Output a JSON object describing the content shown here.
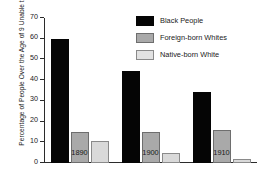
{
  "chart_data": {
    "type": "bar",
    "title": "",
    "xlabel": "",
    "ylabel": "Percentage of People Over the Age of 9 Unable to Read",
    "categories": [
      "1890",
      "1900",
      "1910"
    ],
    "ylim": [
      0,
      70
    ],
    "yticks": [
      0,
      10,
      20,
      30,
      40,
      50,
      60,
      70
    ],
    "ytick_labels": [
      "0",
      "10",
      "20",
      "30",
      "40",
      "50",
      "60",
      "70"
    ],
    "grid": false,
    "legend_position": "top-right",
    "series": [
      {
        "name": "Black People",
        "color": "#050505",
        "values": [
          60.0,
          44.5,
          34.3
        ]
      },
      {
        "name": "Foreign-born Whites",
        "color": "#a9a9a9",
        "values": [
          15.0,
          14.8,
          15.8
        ]
      },
      {
        "name": "Native-born White",
        "color": "#d9d9d9",
        "values": [
          10.5,
          5.0,
          2.0
        ]
      }
    ]
  }
}
